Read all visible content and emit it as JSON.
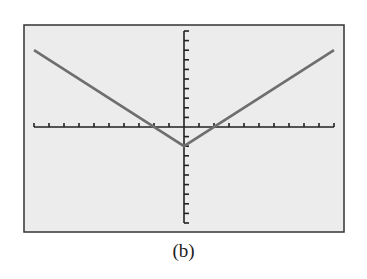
{
  "caption": "(b)",
  "colors": {
    "screen_bg": "#ececec",
    "frame": "#333333",
    "axis": "#222222",
    "curve": "#6e6e6e"
  },
  "chart_data": {
    "type": "line",
    "title": "",
    "xlabel": "",
    "ylabel": "",
    "xlim": [
      -10,
      10
    ],
    "ylim": [
      -10,
      10
    ],
    "x_tick_step": 1,
    "y_tick_step": 1,
    "grid": false,
    "series": [
      {
        "name": "y = |x| - 2",
        "x": [
          -10,
          0,
          10
        ],
        "y": [
          8,
          -2,
          8
        ]
      }
    ]
  }
}
